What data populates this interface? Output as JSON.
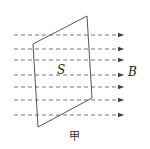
{
  "diagram": {
    "surface_label": "S",
    "field_label": "B",
    "caption": "甲",
    "field_line_count": 7,
    "colors": {
      "line": "#444444",
      "field": "#555555"
    }
  }
}
